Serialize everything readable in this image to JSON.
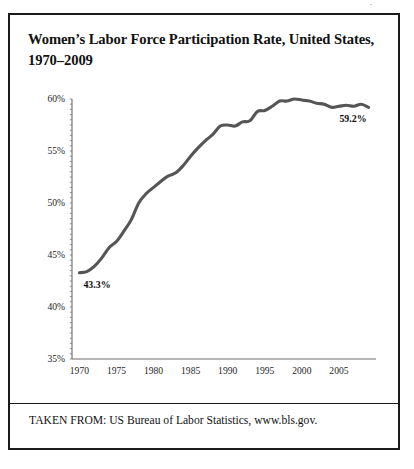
{
  "figure": {
    "title": "Women’s Labor Force Participation Rate, United States, 1970–2009",
    "source": "TAKEN FROM: US Bureau of Labor Statistics, www.bls.gov.",
    "page_mark": "·",
    "line_color": "#555555",
    "axis_color": "#6b6b6b",
    "border_color": "#1a1a1a",
    "text_color": "#111111"
  },
  "chart_data": {
    "type": "line",
    "title": "Women’s Labor Force Participation Rate, United States, 1970–2009",
    "xlabel": "",
    "ylabel": "",
    "xlim": [
      1969,
      2010
    ],
    "ylim": [
      35,
      60
    ],
    "yticks": [
      "35%",
      "40%",
      "45%",
      "50%",
      "55%",
      "60%"
    ],
    "ytick_values": [
      35,
      40,
      45,
      50,
      55,
      60
    ],
    "xticks": [
      "1970",
      "1975",
      "1980",
      "1985",
      "1990",
      "1995",
      "2000",
      "2005"
    ],
    "xtick_values": [
      1970,
      1975,
      1980,
      1985,
      1990,
      1995,
      2000,
      2005
    ],
    "grid": false,
    "legend": "none",
    "annotations": [
      {
        "text": "43.3%",
        "x": 1970,
        "y": 43.3,
        "position": "below-right"
      },
      {
        "text": "59.2%",
        "x": 2009,
        "y": 59.2,
        "position": "below-left"
      }
    ],
    "series": [
      {
        "name": "Women's Labor Force Participation Rate",
        "x": [
          1970,
          1971,
          1972,
          1973,
          1974,
          1975,
          1976,
          1977,
          1978,
          1979,
          1980,
          1981,
          1982,
          1983,
          1984,
          1985,
          1986,
          1987,
          1988,
          1989,
          1990,
          1991,
          1992,
          1993,
          1994,
          1995,
          1996,
          1997,
          1998,
          1999,
          2000,
          2001,
          2002,
          2003,
          2004,
          2005,
          2006,
          2007,
          2008,
          2009
        ],
        "values": [
          43.3,
          43.4,
          43.9,
          44.7,
          45.7,
          46.3,
          47.3,
          48.4,
          50.0,
          50.9,
          51.5,
          52.1,
          52.6,
          52.9,
          53.6,
          54.5,
          55.3,
          56.0,
          56.6,
          57.4,
          57.5,
          57.4,
          57.8,
          57.9,
          58.8,
          58.9,
          59.3,
          59.8,
          59.8,
          60.0,
          59.9,
          59.8,
          59.6,
          59.5,
          59.2,
          59.3,
          59.4,
          59.3,
          59.5,
          59.2
        ]
      }
    ]
  }
}
